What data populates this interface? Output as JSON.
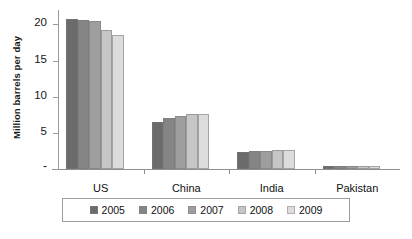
{
  "chart_data": {
    "type": "bar",
    "title": "",
    "subtitle": "",
    "xlabel": "",
    "ylabel": "Million barrels per day",
    "categories": [
      "US",
      "China",
      "India",
      "Pakistan"
    ],
    "series": [
      {
        "name": "2005",
        "color": "#6b6b6b",
        "values": [
          20.7,
          6.5,
          2.3,
          0.35
        ]
      },
      {
        "name": "2006",
        "color": "#858585",
        "values": [
          20.6,
          7.0,
          2.45,
          0.35
        ]
      },
      {
        "name": "2007",
        "color": "#9e9e9e",
        "values": [
          20.5,
          7.4,
          2.55,
          0.37
        ]
      },
      {
        "name": "2008",
        "color": "#c6c6c6",
        "values": [
          19.3,
          7.6,
          2.65,
          0.38
        ]
      },
      {
        "name": "2009",
        "color": "#dcdcdc",
        "values": [
          18.6,
          7.6,
          2.65,
          0.38
        ]
      }
    ],
    "ylim": [
      0,
      22
    ],
    "yticks": [
      0,
      5,
      10,
      15,
      20
    ],
    "ytick_labels": [
      "-",
      "5",
      "10",
      "15",
      "20"
    ],
    "grid": false,
    "legend_position": "bottom",
    "orientation": "vertical"
  },
  "axis": {
    "y_title": "Million barrels per day"
  }
}
